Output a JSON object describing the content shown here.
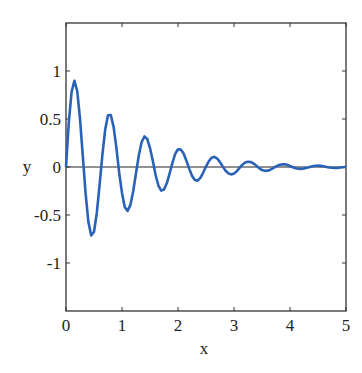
{
  "chart_data": {
    "type": "line",
    "title": "",
    "xlabel": "x",
    "ylabel": "y",
    "xlim": [
      0,
      5
    ],
    "ylim": [
      -1.5,
      1.5
    ],
    "xticks": [
      0,
      1,
      2,
      3,
      4,
      5
    ],
    "xtick_labels": [
      "0",
      "1",
      "2",
      "3",
      "4",
      "5"
    ],
    "yticks": [
      -1,
      -0.5,
      0,
      0.5,
      1
    ],
    "ytick_labels": [
      "-1",
      "-0.5",
      "0",
      "0.5",
      "1"
    ],
    "grid": false,
    "legend": null,
    "zero_line": true,
    "series": [
      {
        "name": "y",
        "color": "#2a62b8",
        "description": "damped sine, approx y = exp(-0.7x)·sin(10x)",
        "x": [
          0,
          0.05,
          0.1,
          0.15,
          0.2,
          0.25,
          0.3,
          0.35,
          0.4,
          0.45,
          0.5,
          0.55,
          0.6,
          0.65,
          0.7,
          0.75,
          0.8,
          0.85,
          0.9,
          0.95,
          1.0,
          1.05,
          1.1,
          1.15,
          1.2,
          1.25,
          1.3,
          1.35,
          1.4,
          1.45,
          1.5,
          1.55,
          1.6,
          1.65,
          1.7,
          1.75,
          1.8,
          1.85,
          1.9,
          1.95,
          2.0,
          2.05,
          2.1,
          2.15,
          2.2,
          2.25,
          2.3,
          2.35,
          2.4,
          2.45,
          2.5,
          2.55,
          2.6,
          2.65,
          2.7,
          2.75,
          2.8,
          2.85,
          2.9,
          2.95,
          3.0,
          3.05,
          3.1,
          3.15,
          3.2,
          3.25,
          3.3,
          3.35,
          3.4,
          3.45,
          3.5,
          3.55,
          3.6,
          3.65,
          3.7,
          3.75,
          3.8,
          3.85,
          3.9,
          3.95,
          4.0,
          4.05,
          4.1,
          4.15,
          4.2,
          4.25,
          4.3,
          4.35,
          4.4,
          4.45,
          4.5,
          4.55,
          4.6,
          4.65,
          4.7,
          4.75,
          4.8,
          4.85,
          4.9,
          4.95,
          5.0
        ],
        "y": [
          0,
          0.464,
          0.782,
          0.899,
          0.792,
          0.503,
          0.114,
          -0.275,
          -0.573,
          -0.713,
          -0.674,
          -0.479,
          -0.185,
          0.129,
          0.39,
          0.538,
          0.542,
          0.418,
          0.2,
          -0.062,
          -0.27,
          -0.418,
          -0.458,
          -0.395,
          -0.252,
          -0.065,
          0.12,
          0.258,
          0.318,
          0.293,
          0.197,
          0.065,
          -0.083,
          -0.193,
          -0.246,
          -0.235,
          -0.17,
          -0.068,
          0.043,
          0.136,
          0.185,
          0.183,
          0.14,
          0.066,
          -0.017,
          -0.092,
          -0.135,
          -0.142,
          -0.113,
          -0.058,
          0.005,
          0.06,
          0.097,
          0.106,
          0.088,
          0.051,
          0.004,
          -0.039,
          -0.067,
          -0.077,
          -0.069,
          -0.044,
          -0.01,
          0.024,
          0.046,
          0.055,
          0.052,
          0.036,
          0.012,
          -0.012,
          -0.032,
          -0.04,
          -0.038,
          -0.028,
          -0.012,
          0.007,
          0.02,
          0.027,
          0.028,
          0.022,
          0.01,
          -0.003,
          -0.013,
          -0.019,
          -0.02,
          -0.016,
          -0.009,
          0.001,
          0.008,
          0.013,
          0.014,
          0.012,
          0.007,
          0.001,
          -0.005,
          -0.008,
          -0.01,
          -0.009,
          -0.006,
          -0.002,
          0.002
        ]
      }
    ]
  },
  "axes": {
    "x_label": "x",
    "y_label": "y"
  }
}
